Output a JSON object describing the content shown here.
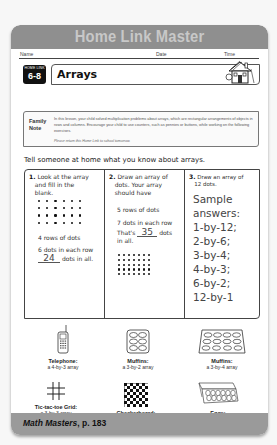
{
  "banner": {
    "title": "Home Link Master"
  },
  "header_fields": {
    "name": "Name",
    "date": "Date",
    "time": "Time"
  },
  "badge": {
    "label": "HOME LINK",
    "number": "6-8"
  },
  "lesson": {
    "title": "Arrays"
  },
  "family_note": {
    "label_line1": "Family",
    "label_line2": "Note",
    "text": "In this lesson, your child solved multiplication problems about arrays, which are rectangular arrangements of objects in rows and columns. Encourage your child to use counters, such as pennies or buttons, while working on the following exercises.",
    "return_text": "Please return this Home Link to school tomorrow."
  },
  "intro": "Tell someone at home what you know about arrays.",
  "problems": [
    {
      "number": "1.",
      "prompt": [
        "Look at the array",
        "and fill in the",
        "blank."
      ],
      "array": {
        "rows": 4,
        "cols": 6
      },
      "rows_text": "4 rows of dots",
      "each_text": "6 dots in each row",
      "answer": "24",
      "answer_suffix": "dots in all."
    },
    {
      "number": "2.",
      "prompt": [
        "Draw an array of",
        "dots. Your array",
        "should have"
      ],
      "rows_text": "5 rows of dots",
      "each_text": "7 dots in each row",
      "thats": "That's",
      "answer": "35",
      "answer_suffix": "dots",
      "in_all": "in all.",
      "array": {
        "rows": 5,
        "cols": 7
      }
    },
    {
      "number": "3.",
      "prompt": [
        "Draw an array of",
        "12 dots."
      ],
      "sample_answers": [
        "Sample",
        "answers:",
        "1-by-12;",
        "2-by-6;",
        "3-by-4;",
        "4-by-3;",
        "6-by-2;",
        "12-by-1"
      ]
    }
  ],
  "examples": [
    {
      "icon": "telephone-icon",
      "label": "Telephone:",
      "desc": "a 4-by-3 array"
    },
    {
      "icon": "muffin-tin-small-icon",
      "label": "Muffins:",
      "desc": "a 3-by-2 array"
    },
    {
      "icon": "muffin-tin-large-icon",
      "label": "Muffins:",
      "desc": "a 3-by-4 array"
    },
    {
      "icon": "tic-tac-toe-icon",
      "label": "Tic-tac-toe Grid:",
      "desc": "a 3-by-3 array"
    },
    {
      "icon": "checkerboard-icon",
      "label": "Checkerboard:",
      "desc": "an 8-by-8 array"
    },
    {
      "icon": "egg-carton-icon",
      "label": "Eggs:",
      "desc": "a 2-by-6 array"
    }
  ],
  "footer": {
    "book": "Math Masters",
    "page": ", p. 183"
  },
  "colors": {
    "banner": "#8f8f8f",
    "banner_text": "#c8c8c8",
    "footer": "#9a9a9a",
    "badge": "#111111"
  }
}
